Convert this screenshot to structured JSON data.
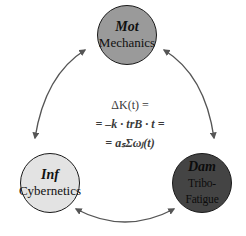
{
  "diagram": {
    "nodes": [
      {
        "id": "mot",
        "abbr": "Mot",
        "name": "Mechanics",
        "fill": "#9a9a9a"
      },
      {
        "id": "inf",
        "abbr": "Inf",
        "name": "Cybernetics",
        "fill": "#e3e3e3"
      },
      {
        "id": "dam",
        "abbr": "Dam",
        "name": "Tribo-Fatigue",
        "fill": "#444444"
      }
    ],
    "edges": [
      {
        "from": "mot",
        "to": "inf",
        "direction": "bidirectional"
      },
      {
        "from": "mot",
        "to": "dam",
        "direction": "bidirectional"
      },
      {
        "from": "inf",
        "to": "dam",
        "direction": "bidirectional"
      }
    ],
    "formula": {
      "line1": "ΔK(t) =",
      "line2": "= –k · trB · t =",
      "line3": "= aₛΣωⱼ(t)"
    },
    "colors": {
      "arrow": "#555555",
      "outline": "#1a1a1a"
    }
  }
}
